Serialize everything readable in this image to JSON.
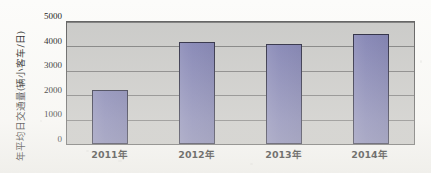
{
  "chart_data": {
    "type": "bar",
    "title": "",
    "subtitle": "",
    "xlabel": "",
    "ylabel": "年平均日交通量(辆小客车/日)",
    "categories": [
      "2011年",
      "2012年",
      "2013年",
      "2014年"
    ],
    "values": [
      2200,
      4200,
      4100,
      4500
    ],
    "series": [
      {
        "name": "年平均日交通量",
        "values": [
          2200,
          4200,
          4100,
          4500
        ]
      }
    ],
    "ylim": [
      0,
      5000
    ],
    "y_ticks": [
      0,
      1000,
      2000,
      3000,
      4000,
      5000
    ],
    "y_tick_labels": [
      "0",
      "1000",
      "2000",
      "3000",
      "4000",
      "5000"
    ],
    "grid": true,
    "gridlines": "horizontal",
    "legend": false,
    "legend_position": "none",
    "bar_color": "#7b7cb0",
    "bar_border_color": "#22223a",
    "plot_background_color": "#c9c9c7",
    "page_background_color": "#fcfcfa",
    "axis_color": "#5d5d5d",
    "text_color": "#141414"
  },
  "axes": {
    "y_title": "年平均日交通量(辆小客车/日)",
    "y_tick_0": "0",
    "y_tick_1": "1000",
    "y_tick_2": "2000",
    "y_tick_3": "3000",
    "y_tick_4": "4000",
    "y_tick_5": "5000",
    "x_tick_0": "2011年",
    "x_tick_1": "2012年",
    "x_tick_2": "2013年",
    "x_tick_3": "2014年"
  }
}
